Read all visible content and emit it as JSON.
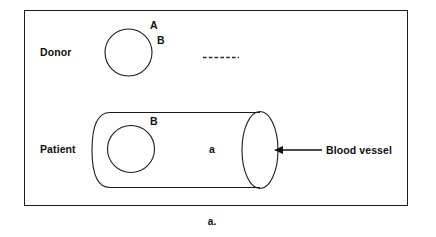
{
  "figure": {
    "caption": "a.",
    "rows": {
      "donor": {
        "label": "Donor",
        "cell_marks": [
          "A",
          "B"
        ]
      },
      "patient": {
        "label": "Patient",
        "cell_mark": "B",
        "plasma_mark": "a"
      }
    },
    "annotation": {
      "blood_vessel_label": "Blood vessel"
    },
    "colors": {
      "stroke": "#1a1a1a",
      "text": "#101010",
      "background": "#ffffff"
    }
  }
}
